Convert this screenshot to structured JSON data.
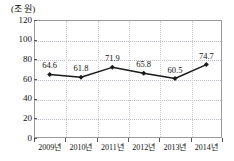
{
  "chart_data": {
    "type": "line",
    "title": "",
    "subtitle": "",
    "unit_label": "(조 원)",
    "xlabel": "",
    "ylabel": "",
    "categories": [
      "2009년",
      "2010년",
      "2011년",
      "2012년",
      "2013년",
      "2014년"
    ],
    "values": [
      64.6,
      61.8,
      71.9,
      65.8,
      60.5,
      74.7
    ],
    "point_labels": [
      "64.6",
      "61.8",
      "71.9",
      "65.8",
      "60.5",
      "74.7"
    ],
    "series": [
      {
        "name": "",
        "values": [
          64.6,
          61.8,
          71.9,
          65.8,
          60.5,
          74.7
        ]
      }
    ],
    "ylim": [
      0,
      120
    ],
    "yticks": [
      0,
      20,
      40,
      60,
      80,
      100,
      120
    ],
    "ytick_labels": [
      "0",
      "20",
      "40",
      "60",
      "80",
      "100",
      "120"
    ],
    "grid": true,
    "grid_style": "dotted",
    "legend": false,
    "legend_position": "none",
    "marker": "diamond",
    "line_color": "#1a1a1a",
    "marker_color": "#1a1a1a",
    "grid_color": "#b9b9c4",
    "frame_color": "#9a9a9a",
    "text_color": "#111111"
  }
}
